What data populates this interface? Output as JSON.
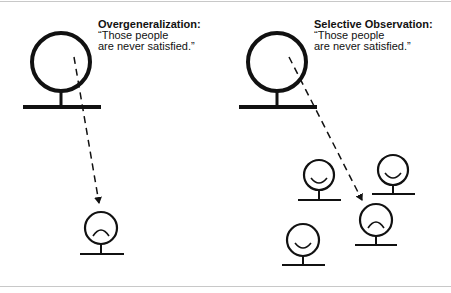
{
  "panels": [
    {
      "id": "overgeneralization",
      "title": "Overgeneralization:",
      "quote_line1": "“Those people",
      "quote_line2": "are never satisfied.”",
      "observer_icon": "large-person-icon",
      "observed": [
        {
          "mood": "frown",
          "icon": "sad-person-icon"
        }
      ]
    },
    {
      "id": "selective-observation",
      "title": "Selective Observation:",
      "quote_line1": "“Those people",
      "quote_line2": "are never satisfied.”",
      "observer_icon": "large-person-icon",
      "observed": [
        {
          "mood": "smile",
          "icon": "happy-person-icon"
        },
        {
          "mood": "smile",
          "icon": "happy-person-icon"
        },
        {
          "mood": "frown",
          "icon": "sad-person-icon"
        },
        {
          "mood": "smile",
          "icon": "happy-person-icon"
        }
      ]
    }
  ],
  "colors": {
    "ink": "#111111",
    "rule": "#c8c8c8",
    "background": "#ffffff"
  }
}
